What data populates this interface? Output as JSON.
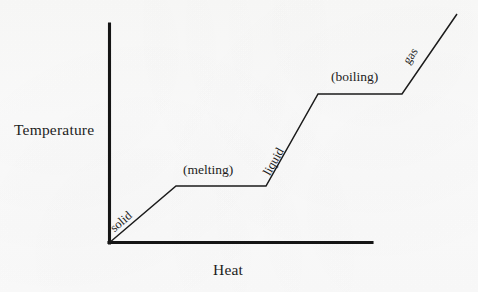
{
  "figure": {
    "kind": "heating-curve-diagram",
    "background_color": "#fdfdfd",
    "ink_color": "#1b1b1b"
  },
  "axes": {
    "y_title": "Temperature",
    "x_title": "Heat",
    "origin": [
      109,
      243
    ],
    "y_axis_top": [
      109,
      24
    ],
    "x_axis_right": [
      372,
      243
    ],
    "ticks": [],
    "grid": false
  },
  "labels": {
    "solid": "solid",
    "melting": "(melting)",
    "liquid": "liquid",
    "boiling": "(boiling)",
    "gas": "gas"
  },
  "chart_data": {
    "type": "line",
    "title": "",
    "subtitle": "",
    "xlabel": "Heat",
    "ylabel": "Temperature",
    "xlim": [
      0,
      100
    ],
    "ylim": [
      0,
      100
    ],
    "grid": false,
    "legend": "none",
    "series": [
      {
        "name": "heating curve",
        "x": [
          0,
          25.5,
          59.7,
          79.5,
          111.4,
          132.3
        ],
        "y": [
          0,
          26.0,
          26.0,
          68.0,
          68.0,
          104.6
        ],
        "points_px": [
          [
            109,
            243
          ],
          [
            176,
            186
          ],
          [
            266,
            186
          ],
          [
            318,
            94
          ],
          [
            402,
            94
          ],
          [
            457,
            14
          ]
        ]
      }
    ],
    "segments": [
      {
        "phase": "solid",
        "label": "solid",
        "kind": "rising",
        "from_px": [
          109,
          243
        ],
        "to_px": [
          176,
          186
        ]
      },
      {
        "phase": "melting",
        "label": "(melting)",
        "kind": "plateau",
        "from_px": [
          176,
          186
        ],
        "to_px": [
          266,
          186
        ]
      },
      {
        "phase": "liquid",
        "label": "liquid",
        "kind": "rising",
        "from_px": [
          266,
          186
        ],
        "to_px": [
          318,
          94
        ]
      },
      {
        "phase": "boiling",
        "label": "(boiling)",
        "kind": "plateau",
        "from_px": [
          318,
          94
        ],
        "to_px": [
          402,
          94
        ]
      },
      {
        "phase": "gas",
        "label": "gas",
        "kind": "rising",
        "from_px": [
          402,
          94
        ],
        "to_px": [
          457,
          14
        ]
      }
    ],
    "annotations": [
      {
        "text": "solid",
        "rotation_deg": -40.5,
        "at_px": [
          116,
          222
        ]
      },
      {
        "text": "(melting)",
        "rotation_deg": 0,
        "at_px": [
          183,
          163
        ]
      },
      {
        "text": "liquid",
        "rotation_deg": -60.5,
        "at_px": [
          272,
          165
        ]
      },
      {
        "text": "(boiling)",
        "rotation_deg": 0,
        "at_px": [
          331,
          70
        ]
      },
      {
        "text": "gas",
        "rotation_deg": -55.5,
        "at_px": [
          411,
          54
        ]
      }
    ]
  }
}
